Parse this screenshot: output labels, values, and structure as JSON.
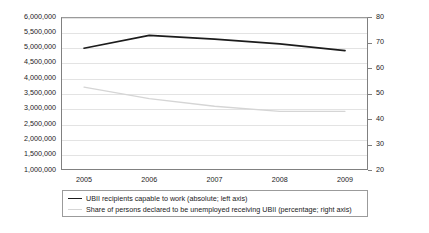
{
  "chart_data": {
    "type": "line",
    "title": "",
    "xlabel": "",
    "categories": [
      "2005",
      "2006",
      "2007",
      "2008",
      "2009"
    ],
    "x": [
      2005,
      2006,
      2007,
      2008,
      2009
    ],
    "grid": true,
    "legend_position": "bottom",
    "axes": {
      "left": {
        "label": "",
        "min": 1000000,
        "max": 6000000,
        "step": 500000,
        "ticks": [
          "1,000,000",
          "1,500,000",
          "2,000,000",
          "2,500,000",
          "3,000,000",
          "3,500,000",
          "4,000,000",
          "4,500,000",
          "5,000,000",
          "5,500,000",
          "6,000,000"
        ],
        "tick_values": [
          1000000,
          1500000,
          2000000,
          2500000,
          3000000,
          3500000,
          4000000,
          4500000,
          5000000,
          5500000,
          6000000
        ]
      },
      "right": {
        "label": "",
        "min": 20,
        "max": 80,
        "step": 10,
        "ticks": [
          "20",
          "30",
          "40",
          "50",
          "60",
          "70",
          "80"
        ],
        "tick_values": [
          20,
          30,
          40,
          50,
          60,
          70,
          80
        ]
      }
    },
    "series": [
      {
        "name": "UBII recipients capable to work (absolute; left axis)",
        "axis": "left",
        "color": "#1c1c1c",
        "values": [
          4980000,
          5400000,
          5280000,
          5120000,
          4900000
        ]
      },
      {
        "name": "Share of persons declared to be unemployed receiving UBII (percentage; right axis)",
        "axis": "right",
        "color": "#d5d5d5",
        "values": [
          52.5,
          48.0,
          45.0,
          43.0,
          43.0
        ]
      }
    ]
  },
  "legend": {
    "entries": [
      {
        "label": "UBII recipients capable to work (absolute; left axis)",
        "marker": "line-dark"
      },
      {
        "label": "Share of persons declared to be unemployed receiving UBII (percentage; right axis)",
        "marker": "line-gray"
      }
    ]
  }
}
